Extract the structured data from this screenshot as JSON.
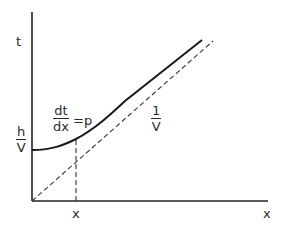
{
  "diagram": {
    "axes": {
      "y_label": "t",
      "x_label": "x",
      "x_tick_label": "x"
    },
    "labels": {
      "intercept": {
        "numerator": "h",
        "denominator": "V"
      },
      "slope_curve": {
        "numerator": "dt",
        "denominator": "dx",
        "rhs": "=p"
      },
      "slope_asymptote": {
        "numerator": "1",
        "denominator": "V"
      }
    },
    "curves": [
      {
        "name": "travel-time-curve",
        "style": "solid",
        "description": "hyperbola starting at h/V on t-axis, asymptotic to line of slope 1/V"
      },
      {
        "name": "asymptote-line",
        "style": "dashed",
        "description": "straight line through origin with slope 1/V"
      },
      {
        "name": "x-marker-line",
        "style": "dashed",
        "description": "vertical line at x where dt/dx = p"
      }
    ],
    "colors": {
      "line": "#222222",
      "background": "#ffffff"
    }
  }
}
